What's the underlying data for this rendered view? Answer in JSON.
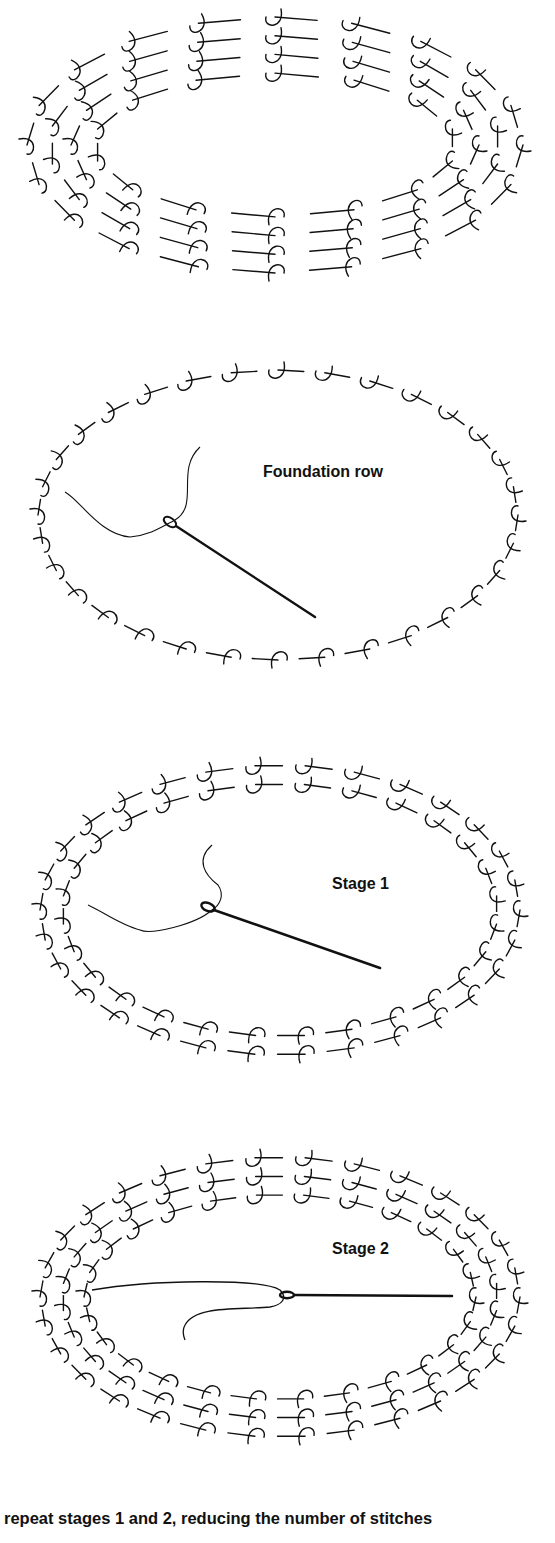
{
  "figure": {
    "panels": [
      {
        "id": "completed",
        "label": "",
        "rings": 4,
        "loops": 20,
        "cx": 275,
        "cy": 145,
        "rx": 258,
        "ry": 138,
        "top": 0,
        "height": 300,
        "needle": null
      },
      {
        "id": "foundation",
        "label": "Foundation row",
        "rings": 1,
        "loops": 32,
        "cx": 278,
        "cy": 515,
        "rx": 250,
        "ry": 155,
        "top": 330,
        "height": 370,
        "needle": "diagonal"
      },
      {
        "id": "stage1",
        "label": "Stage 1",
        "rings": 2,
        "loops": 30,
        "cx": 280,
        "cy": 910,
        "rx": 250,
        "ry": 155,
        "top": 730,
        "height": 360,
        "needle": "diagonal"
      },
      {
        "id": "stage2",
        "label": "Stage 2",
        "rings": 3,
        "loops": 30,
        "cx": 280,
        "cy": 1297,
        "rx": 250,
        "ry": 150,
        "top": 1120,
        "height": 360,
        "needle": "horizontal"
      }
    ],
    "labels": {
      "foundation": "Foundation row",
      "stage1": "Stage 1",
      "stage2": "Stage 2"
    },
    "caption": "repeat stages 1 and 2,  reducing the number of stitches",
    "colors": {
      "ink": "#111111",
      "background": "#ffffff"
    }
  }
}
